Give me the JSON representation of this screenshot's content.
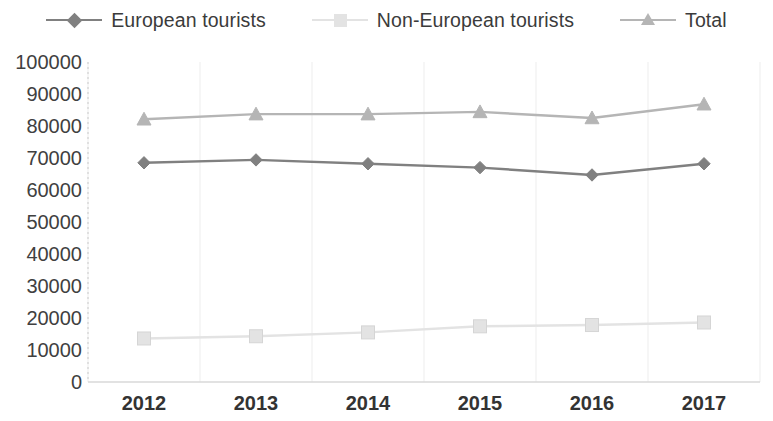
{
  "chart_data": {
    "type": "line",
    "title": "",
    "subtitle": "",
    "xlabel": "",
    "ylabel": "",
    "categories": [
      "2012",
      "2013",
      "2014",
      "2015",
      "2016",
      "2017"
    ],
    "x": [
      2012,
      2013,
      2014,
      2015,
      2016,
      2017
    ],
    "ylim": [
      0,
      100000
    ],
    "y_ticks": [
      "100000",
      "90000",
      "80000",
      "70000",
      "60000",
      "50000",
      "40000",
      "30000",
      "20000",
      "10000",
      "0"
    ],
    "y_tick_values": [
      100000,
      90000,
      80000,
      70000,
      60000,
      50000,
      40000,
      30000,
      20000,
      10000,
      0
    ],
    "y_tick_step": 10000,
    "grid": "vertical-light",
    "legend_position": "top-center",
    "series": [
      {
        "name": "European tourists",
        "marker": "diamond",
        "color": "#808080",
        "values": [
          68500,
          69400,
          68200,
          67000,
          64700,
          68200
        ]
      },
      {
        "name": "Non-European tourists",
        "marker": "square",
        "color": "#e3e3e3",
        "values": [
          13600,
          14300,
          15500,
          17400,
          17800,
          18600
        ]
      },
      {
        "name": "Total",
        "marker": "triangle",
        "color": "#b5b5b5",
        "values": [
          82100,
          83700,
          83700,
          84400,
          82500,
          86800
        ]
      }
    ]
  },
  "legend": {
    "entries": [
      {
        "label": "European tourists",
        "icon": "diamond-marker-icon"
      },
      {
        "label": "Non-European tourists",
        "icon": "square-marker-icon"
      },
      {
        "label": "Total",
        "icon": "triangle-marker-icon"
      }
    ]
  },
  "colors": {
    "european": "#808080",
    "non_european": "#e3e3e3",
    "total": "#b5b5b5",
    "gridline": "#ededed",
    "axis": "#d9d9d9",
    "text": "#3b3b3b",
    "background": "#ffffff"
  }
}
